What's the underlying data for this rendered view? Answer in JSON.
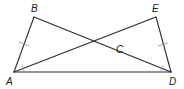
{
  "diagram": {
    "type": "geometry-figure",
    "points": [
      {
        "id": "A",
        "label": "A"
      },
      {
        "id": "B",
        "label": "B"
      },
      {
        "id": "C",
        "label": "C"
      },
      {
        "id": "D",
        "label": "D"
      },
      {
        "id": "E",
        "label": "E"
      }
    ],
    "segments": [
      {
        "from": "A",
        "to": "B"
      },
      {
        "from": "B",
        "to": "D"
      },
      {
        "from": "A",
        "to": "E"
      },
      {
        "from": "E",
        "to": "D"
      },
      {
        "from": "A",
        "to": "D"
      }
    ],
    "intersection": {
      "point": "C",
      "of": [
        "BD",
        "AE"
      ]
    },
    "congruent_segments": [
      [
        "AB",
        "DE"
      ]
    ],
    "congruent_angles": [
      [
        "BAD",
        "EDA"
      ]
    ],
    "stroke_color": "#2b2b2b",
    "mark_color": "#9a9a9a"
  }
}
